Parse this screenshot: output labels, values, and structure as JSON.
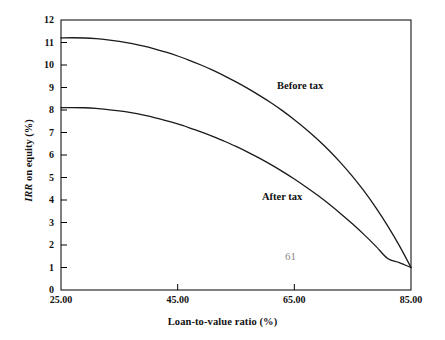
{
  "figure": {
    "page_number": "61",
    "background_color": "#ffffff",
    "line_color": "#1a1a1a",
    "axis_color": "#000000",
    "page_number_color": "#8a8a8a"
  },
  "chart_data": {
    "type": "line",
    "title": "",
    "xlabel": "Loan-to-value ratio (%)",
    "ylabel": "IRR on equity (%)",
    "ylabel_italic_part": "IRR",
    "ylabel_rest": " on equity (%)",
    "xlim": [
      25,
      85
    ],
    "ylim": [
      0,
      12
    ],
    "xticks": [
      25,
      45,
      65,
      85
    ],
    "xtick_labels": [
      "25.00",
      "45.00",
      "65.00",
      "85.00"
    ],
    "yticks": [
      0,
      1,
      2,
      3,
      4,
      5,
      6,
      7,
      8,
      9,
      10,
      11,
      12
    ],
    "ytick_labels": [
      "0",
      "1",
      "2",
      "3",
      "4",
      "5",
      "6",
      "7",
      "8",
      "9",
      "10",
      "11",
      "12"
    ],
    "grid": false,
    "legend_position": "inline-annotation",
    "annotations": [
      {
        "text": "Before tax",
        "x": 66.5,
        "y": 9.1
      },
      {
        "text": "After tax",
        "x": 64.0,
        "y": 4.2
      }
    ],
    "series": [
      {
        "name": "Before tax",
        "x": [
          25,
          27,
          29,
          31,
          33,
          35,
          37,
          39,
          41,
          43,
          45,
          47,
          49,
          51,
          53,
          55,
          57,
          59,
          61,
          63,
          65,
          67,
          69,
          71,
          73,
          75,
          77,
          79,
          81,
          83,
          85
        ],
        "values": [
          11.2,
          11.21,
          11.2,
          11.17,
          11.12,
          11.05,
          10.96,
          10.85,
          10.72,
          10.57,
          10.4,
          10.21,
          10.0,
          9.77,
          9.52,
          9.25,
          8.96,
          8.65,
          8.32,
          7.96,
          7.57,
          7.15,
          6.69,
          6.19,
          5.64,
          5.04,
          4.38,
          3.65,
          2.85,
          1.97,
          1.0
        ]
      },
      {
        "name": "After tax",
        "x": [
          25,
          27,
          29,
          31,
          33,
          35,
          37,
          39,
          41,
          43,
          45,
          47,
          49,
          51,
          53,
          55,
          57,
          59,
          61,
          63,
          65,
          67,
          69,
          71,
          73,
          75,
          77,
          79,
          81,
          83,
          85
        ],
        "values": [
          8.1,
          8.11,
          8.1,
          8.07,
          8.02,
          7.96,
          7.88,
          7.78,
          7.66,
          7.53,
          7.38,
          7.21,
          7.03,
          6.83,
          6.61,
          6.38,
          6.13,
          5.86,
          5.57,
          5.26,
          4.93,
          4.58,
          4.21,
          3.81,
          3.38,
          2.93,
          2.45,
          1.94,
          1.4,
          1.22,
          1.0
        ]
      }
    ]
  }
}
